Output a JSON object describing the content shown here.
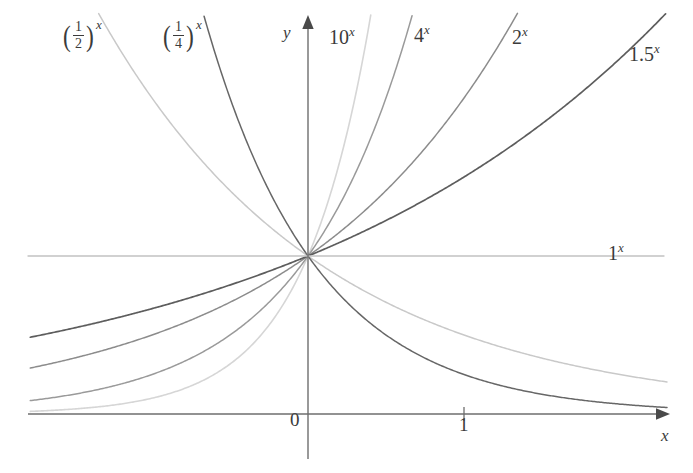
{
  "figure": {
    "background": "#ffffff",
    "axes": {
      "x_axis_label": "x",
      "y_axis_label": "y",
      "origin_label": "0",
      "x_tick_labels": [
        "1"
      ],
      "y_tick_labels": []
    }
  },
  "chart_data": {
    "type": "line",
    "title": "",
    "xlabel": "x",
    "ylabel": "y",
    "grid": false,
    "legend_position": "inline-curve-labels",
    "xlim": [
      -1.78,
      2.42
    ],
    "ylim": [
      -0.1,
      2.72
    ],
    "x_ticks": [
      0,
      1
    ],
    "x_tick_labels": [
      "0",
      "1"
    ],
    "y_ticks": [],
    "y_tick_labels": [],
    "origin_label": "0",
    "note": "All curves pass through the common point (0, 1). Horizontal line y = 1 is 1^x.",
    "series": [
      {
        "name": "(1/2)^x",
        "label_kind": "fraction",
        "numerator": "1",
        "denominator": "2",
        "exponent": "x",
        "base": 0.5,
        "color": "#c9c9c9",
        "width": 1.5,
        "label_x": 62,
        "label_y": 20
      },
      {
        "name": "(1/4)^x",
        "label_kind": "fraction",
        "numerator": "1",
        "denominator": "4",
        "exponent": "x",
        "base": 0.25,
        "color": "#676767",
        "width": 1.5,
        "label_x": 162,
        "label_y": 20
      },
      {
        "name": "10^x",
        "label_kind": "power",
        "mantissa": "10",
        "exponent": "x",
        "base": 10,
        "color": "#d6d6d6",
        "width": 1.6,
        "label_x": 329,
        "label_y": 27
      },
      {
        "name": "4^x",
        "label_kind": "power",
        "mantissa": "4",
        "exponent": "x",
        "base": 4,
        "color": "#9a9a9a",
        "width": 1.5,
        "label_x": 414,
        "label_y": 25
      },
      {
        "name": "2^x",
        "label_kind": "power",
        "mantissa": "2",
        "exponent": "x",
        "base": 2,
        "color": "#8c8c8c",
        "width": 1.5,
        "label_x": 512,
        "label_y": 27
      },
      {
        "name": "1.5^x",
        "label_kind": "power",
        "mantissa": "1.5",
        "exponent": "x",
        "base": 1.5,
        "color": "#5d5d5d",
        "width": 1.7,
        "label_x": 629,
        "label_y": 44
      },
      {
        "name": "1^x",
        "label_kind": "power",
        "mantissa": "1",
        "exponent": "x",
        "base": 1,
        "color": "#c2c2c2",
        "width": 1.3,
        "label_x": 608,
        "label_y": 243
      }
    ]
  }
}
